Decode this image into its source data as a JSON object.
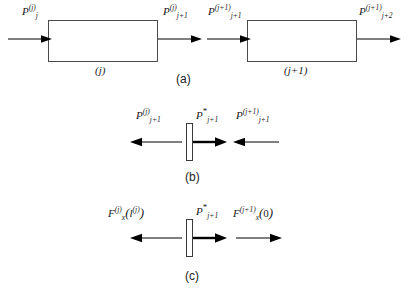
{
  "figure": {
    "panels": [
      {
        "id": "a",
        "letter": "(a)",
        "description": "two adjacent segments with inlet and outlet pressures",
        "boxes": [
          {
            "caption_prefix": "(",
            "caption_index": "j",
            "caption_suffix": ")",
            "caption": "(j)"
          },
          {
            "caption": "(j+1)"
          }
        ],
        "labels": {
          "inlet_left": {
            "base": "P",
            "sub": "j",
            "sup": "(j)"
          },
          "outlet_left": {
            "base": "P",
            "sub": "j+1",
            "sup": "(j)"
          },
          "inlet_right": {
            "base": "P",
            "sub": "j+1",
            "sup": "(j+1)"
          },
          "outlet_right": {
            "base": "P",
            "sub": "j+2",
            "sup": "(j+1)"
          }
        }
      },
      {
        "id": "b",
        "letter": "(b)",
        "description": "pressure balance on the massless interface plate",
        "labels": {
          "left": {
            "base": "P",
            "sub": "j+1",
            "sup": "(j)"
          },
          "center": {
            "base": "P",
            "sub": "j+1",
            "sup": "*"
          },
          "right": {
            "base": "P",
            "sub": "j+1",
            "sup": "(j+1)"
          }
        },
        "arrows": {
          "left_direction": "left",
          "center_direction": "right",
          "right_direction": "left"
        }
      },
      {
        "id": "c",
        "letter": "(c)",
        "description": "axial force balance on the interface plate",
        "labels": {
          "left": {
            "base": "F",
            "sub": "x",
            "sup": "(j)",
            "arg": "( l (j) )",
            "arg_base": "l",
            "arg_sup": "(j)"
          },
          "center": {
            "base": "P",
            "sub": "j+1",
            "sup": "*"
          },
          "right": {
            "base": "F",
            "sub": "x",
            "sup": "(j+1)",
            "arg": "(0)",
            "arg_value": "0"
          }
        },
        "arrows": {
          "left_direction": "left",
          "center_direction": "right",
          "right_direction": "right"
        }
      }
    ],
    "colors": {
      "stroke": "#3a3a3a",
      "arrow_thin": "#000000",
      "arrow_bold": "#000000",
      "text": "#1a1a1a",
      "background": "#ffffff"
    }
  }
}
